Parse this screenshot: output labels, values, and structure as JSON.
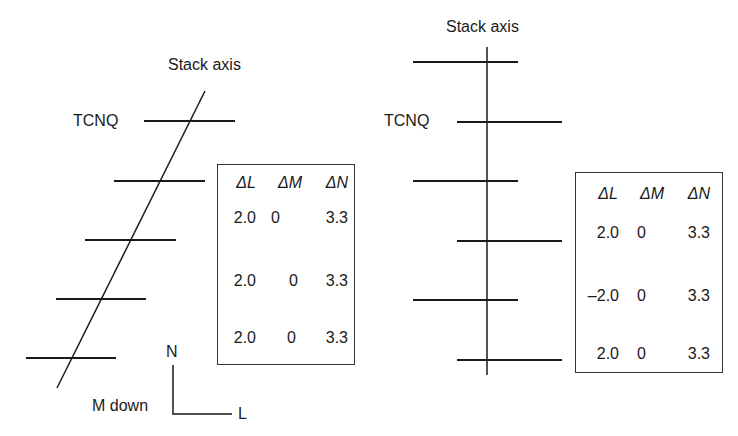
{
  "left_panel": {
    "axis_label": "Stack axis",
    "molecule_label": "TCNQ",
    "table": {
      "headers": [
        "ΔL",
        "ΔM",
        "ΔN"
      ],
      "rows": [
        [
          "2.0",
          "0",
          "3.3"
        ],
        [
          "2.0",
          "0",
          "3.3"
        ],
        [
          "2.0",
          "0",
          "3.3"
        ]
      ]
    },
    "coordinate_frame": {
      "vertical_label": "N",
      "horizontal_label": "L",
      "depth_label": "M down"
    }
  },
  "right_panel": {
    "axis_label": "Stack axis",
    "molecule_label": "TCNQ",
    "table": {
      "headers": [
        "ΔL",
        "ΔM",
        "ΔN"
      ],
      "rows": [
        [
          "2.0",
          "0",
          "3.3"
        ],
        [
          "–2.0",
          "0",
          "3.3"
        ],
        [
          "2.0",
          "0",
          "3.3"
        ]
      ]
    }
  },
  "colors": {
    "line": "#1a1a1a",
    "background": "#ffffff"
  }
}
